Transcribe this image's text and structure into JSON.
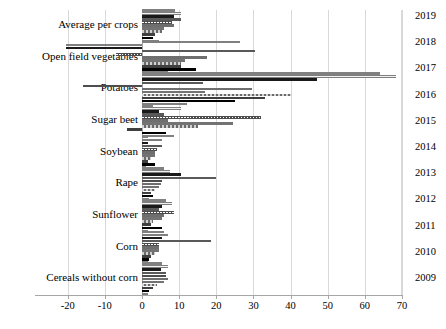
{
  "chart_data": {
    "type": "bar",
    "orientation": "horizontal",
    "title": "",
    "xlabel": "",
    "ylabel": "",
    "xlim": [
      -20,
      70
    ],
    "xticks": [
      -20,
      -10,
      0,
      10,
      20,
      30,
      40,
      50,
      60,
      70
    ],
    "grid": true,
    "legend_position": "right",
    "categories": [
      "Average per crops",
      "Open field vegetables",
      "Potatoes",
      "Sugar beet",
      "Soybean",
      "Rape",
      "Sunflower",
      "Corn",
      "Cereals without corn"
    ],
    "series": [
      {
        "name": "2019",
        "style": "s-gray",
        "values": [
          9.0,
          26.5,
          64.0,
          3.0,
          1.5,
          6.0,
          6.5,
          6.0,
          5.5
        ]
      },
      {
        "name": "2018",
        "style": "s-light",
        "values": [
          10.5,
          -20.5,
          68.5,
          10.5,
          5.5,
          7.5,
          8.0,
          7.0,
          7.0
        ]
      },
      {
        "name": "2017",
        "style": "s-dark",
        "values": [
          8.5,
          -20.5,
          47.0,
          4.5,
          1.5,
          10.5,
          5.5,
          5.5,
          5.0
        ]
      },
      {
        "name": "2016",
        "style": "s-mid",
        "values": [
          10.5,
          30.5,
          16.5,
          6.0,
          5.5,
          20.0,
          4.5,
          18.5,
          6.5
        ]
      },
      {
        "name": "2015",
        "style": "s-hatch",
        "values": [
          8.0,
          -7.0,
          -16.0,
          32.0,
          4.0,
          5.5,
          8.5,
          4.5,
          6.5
        ]
      },
      {
        "name": "2014",
        "style": "s-midgray",
        "values": [
          8.5,
          17.5,
          29.5,
          7.0,
          3.5,
          5.0,
          6.0,
          4.5,
          7.0
        ]
      },
      {
        "name": "2013",
        "style": "s-graymed",
        "values": [
          6.0,
          11.5,
          17.0,
          24.5,
          3.5,
          4.5,
          5.5,
          4.5,
          6.0
        ]
      },
      {
        "name": "2012",
        "style": "s-checker",
        "values": [
          5.5,
          10.5,
          40.5,
          15.0,
          2.5,
          3.5,
          3.0,
          3.5,
          4.0
        ]
      },
      {
        "name": "2011",
        "style": "s-darkgray",
        "values": [
          3.5,
          10.5,
          33.0,
          -4.0,
          1.5,
          2.5,
          2.5,
          2.5,
          3.0
        ]
      },
      {
        "name": "2010",
        "style": "s-black",
        "values": [
          3.0,
          14.5,
          25.0,
          6.5,
          3.5,
          3.0,
          5.5,
          2.0,
          2.0
        ]
      },
      {
        "name": "2009",
        "style": "s-gray",
        "values": [
          4.5,
          7.0,
          12.0,
          8.5,
          1.0,
          2.0,
          1.5,
          1.5,
          1.5
        ]
      }
    ]
  },
  "legend": {
    "items": [
      {
        "label": "2019"
      },
      {
        "label": "2018"
      },
      {
        "label": "2017"
      },
      {
        "label": "2016"
      },
      {
        "label": "2015"
      },
      {
        "label": "2014"
      },
      {
        "label": "2013"
      },
      {
        "label": "2012"
      },
      {
        "label": "2011"
      },
      {
        "label": "2010"
      },
      {
        "label": "2009"
      }
    ]
  },
  "axis": {
    "x_tick_labels": [
      "-20",
      "-10",
      "0",
      "10",
      "20",
      "30",
      "40",
      "50",
      "60",
      "70"
    ]
  }
}
